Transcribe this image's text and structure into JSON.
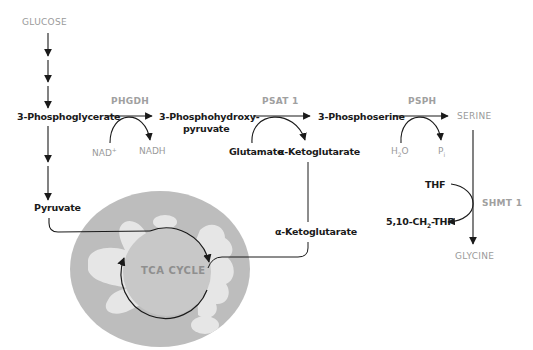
{
  "colors": {
    "arrow": "#1a1a1a",
    "metabolite_bold": "#1a1a1a",
    "metabolite_gray": "#9a9a9a",
    "enzyme": "#a0a0a0",
    "mito_outer": "#bdbdbd",
    "mito_cristae": "#e6e6e6",
    "tca_circle": "#c8c8c8"
  },
  "pathway": {
    "start": "GLUCOSE",
    "glycolysis_intermediate": "3-Phosphoglycerate",
    "glycolysis_end": "Pyruvate",
    "steps": [
      {
        "enzyme": "PHGDH",
        "substrate": "3-Phosphoglycerate",
        "product_line1": "3-Phosphohydroxy-",
        "product_line2": "pyruvate",
        "cofactor_in": "NAD",
        "cofactor_in_sup": "+",
        "cofactor_out": "NADH"
      },
      {
        "enzyme": "PSAT 1",
        "product": "3-Phosphoserine",
        "cofactor_in": "Glutamate",
        "cofactor_out": "α-Ketoglutarate"
      },
      {
        "enzyme": "PSPH",
        "product": "SERINE",
        "cofactor_in_pre": "H",
        "cofactor_in_sub": "2",
        "cofactor_in_post": "O",
        "cofactor_out_pre": "P",
        "cofactor_out_sub": "i"
      },
      {
        "enzyme": "SHMT 1",
        "product": "GLYCINE",
        "cofactor_in": "THF",
        "cofactor_out_pre": "5,10-CH",
        "cofactor_out_sub": "2",
        "cofactor_out_post": "-THF"
      }
    ],
    "mitochondria": {
      "cycle_label": "TCA CYCLE",
      "entry_label": "α-Ketoglutarate"
    }
  }
}
